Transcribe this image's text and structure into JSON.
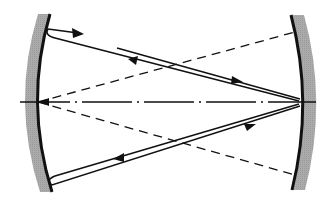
{
  "diagram": {
    "colors": {
      "background": "#ffffff",
      "mirror_surface": "#111111",
      "mirror_substrate": "#a8a8a8",
      "line": "#111111"
    },
    "elements": {
      "left_mirror": "left-concave-mirror",
      "right_mirror": "right-concave-mirror",
      "optical_axis": "dash-dot-axis",
      "dashed_lines": [
        "upper-dashed-line",
        "lower-dashed-line"
      ],
      "rays": [
        "upper-ray-pair",
        "lower-ray-pair"
      ]
    }
  }
}
